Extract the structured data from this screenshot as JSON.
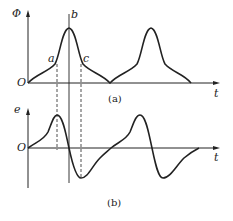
{
  "figure": {
    "top": {
      "y_axis_label": "Φ",
      "x_axis_label": "t",
      "origin_label": "O",
      "caption": "(a)",
      "point_labels": {
        "a": "a",
        "b": "b",
        "c": "c"
      }
    },
    "bottom": {
      "y_axis_label": "e",
      "x_axis_label": "t",
      "origin_label": "O",
      "caption": "(b)"
    }
  }
}
